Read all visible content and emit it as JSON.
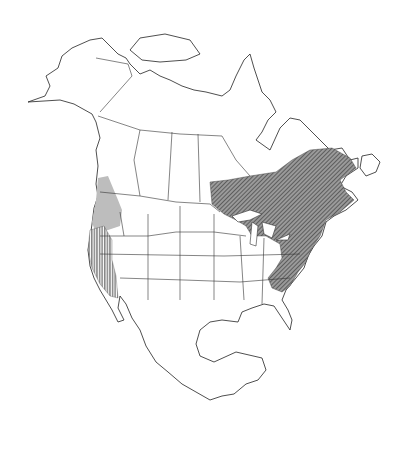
{
  "map": {
    "title": "",
    "region": "North America",
    "legend": [],
    "colors": {
      "background": "#ffffff",
      "outline": "#222222",
      "hatch": "#333333",
      "gray_range": "#bdbdbd"
    },
    "ranges": [
      {
        "name": "eastern-range",
        "style": "diagonal-hatch",
        "areas": [
          "Ontario",
          "Quebec",
          "Maritimes",
          "Great Lakes states",
          "Northeast US",
          "Appalachians"
        ]
      },
      {
        "name": "pacific-northwest-range",
        "style": "gray-fill",
        "areas": [
          "Washington",
          "Oregon",
          "southern British Columbia"
        ]
      },
      {
        "name": "california-range",
        "style": "vertical-hatch",
        "areas": [
          "California"
        ]
      }
    ]
  }
}
